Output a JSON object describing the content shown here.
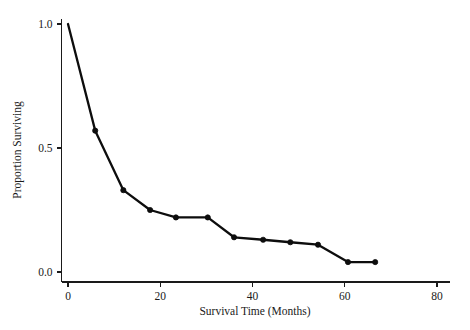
{
  "chart_data": {
    "type": "line",
    "title": "",
    "xlabel": "Survival Time (Months)",
    "ylabel": "Proportion Surviving",
    "xlim": [
      -5,
      82
    ],
    "ylim": [
      -0.04,
      1.05
    ],
    "xticks": [
      0,
      20,
      40,
      60,
      80
    ],
    "xticklabels": [
      "0",
      "20",
      "40",
      "60",
      "80"
    ],
    "yticks": [
      0.0,
      0.5,
      1.0
    ],
    "yticklabels": [
      "0.0",
      "0.5",
      "1.0"
    ],
    "grid": false,
    "legend": "none",
    "marker": "filled-circle",
    "line_color": "#0d0d0d",
    "series": [
      {
        "name": "Proportion Surviving",
        "x": [
          0,
          5.9,
          12.0,
          17.8,
          23.4,
          30.3,
          36.0,
          42.3,
          48.2,
          54.2,
          60.7,
          66.6
        ],
        "y": [
          1.0,
          0.57,
          0.33,
          0.25,
          0.22,
          0.22,
          0.14,
          0.13,
          0.12,
          0.11,
          0.04,
          0.04
        ]
      }
    ]
  },
  "figure": {
    "width": 470,
    "height": 330,
    "background": "#ffffff"
  }
}
